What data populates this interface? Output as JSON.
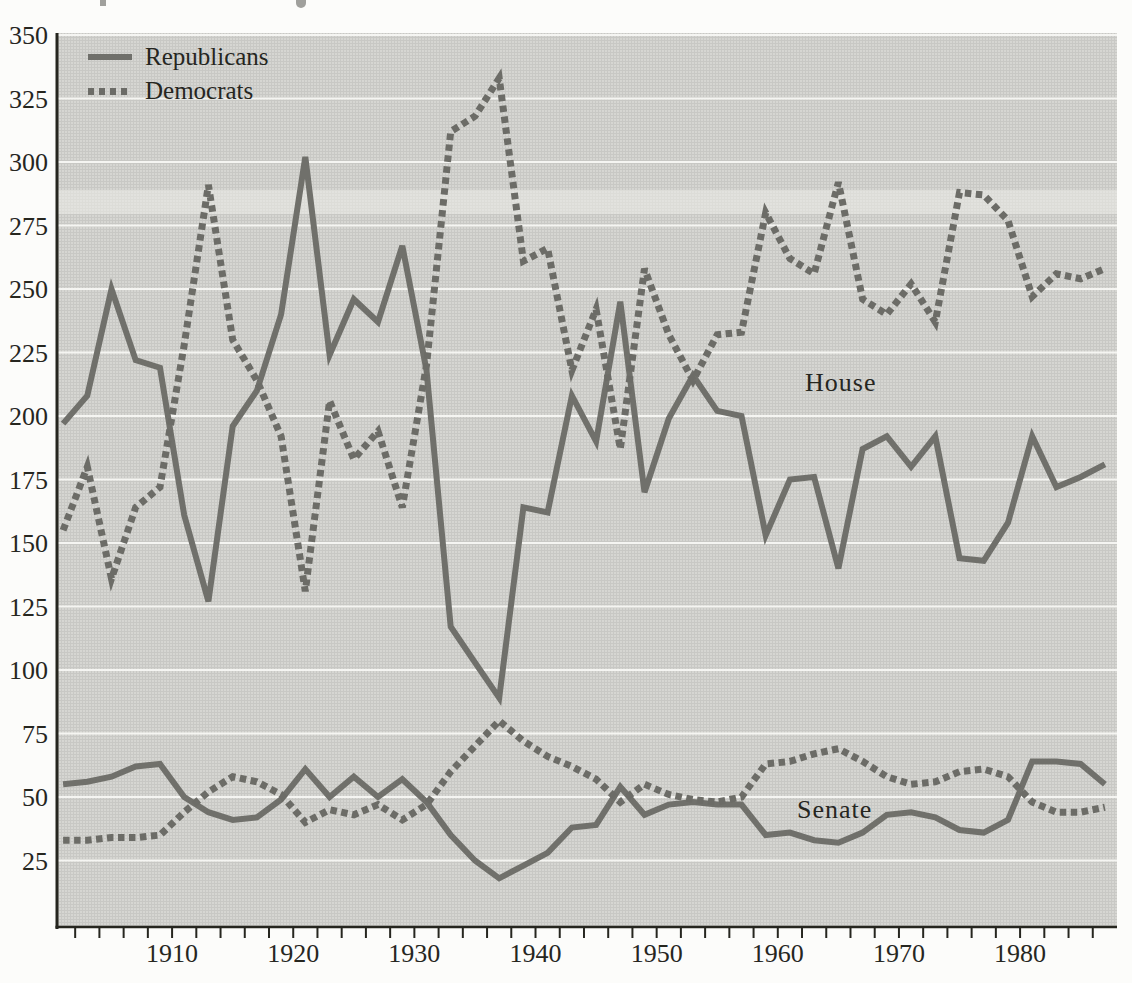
{
  "figure": {
    "background_color": "#fcfcfa",
    "plot_background_color": "#d6d6d2",
    "gridline_color": "#f5f5f2",
    "axis_color": "#26261f",
    "text_color": "#26261f",
    "republican_line_color": "#70706b",
    "democrat_line_color": "#6c6c67"
  },
  "legend": {
    "republicans_label": "Republicans",
    "democrats_label": "Democrats"
  },
  "annotations": {
    "house_label": "House",
    "senate_label": "Senate"
  },
  "chart_data": {
    "type": "line",
    "title": "",
    "xlabel": "",
    "ylabel": "",
    "xlim": [
      1900.5,
      1988
    ],
    "ylim": [
      0,
      350
    ],
    "grid": "horizontal-white",
    "legend_position": "top-left-inside",
    "y_ticks": [
      25,
      50,
      75,
      100,
      125,
      150,
      175,
      200,
      225,
      250,
      275,
      300,
      325,
      350
    ],
    "x_tick_labels": [
      1910,
      1920,
      1930,
      1940,
      1950,
      1960,
      1970,
      1980
    ],
    "x_minor_tick_start": 1902,
    "x_minor_tick_end": 1986,
    "x_minor_tick_step": 2,
    "x": [
      1901,
      1903,
      1905,
      1907,
      1909,
      1911,
      1913,
      1915,
      1917,
      1919,
      1921,
      1923,
      1925,
      1927,
      1929,
      1931,
      1933,
      1935,
      1937,
      1939,
      1941,
      1943,
      1945,
      1947,
      1949,
      1951,
      1953,
      1955,
      1957,
      1959,
      1961,
      1963,
      1965,
      1967,
      1969,
      1971,
      1973,
      1975,
      1977,
      1979,
      1981,
      1983,
      1985,
      1987
    ],
    "series": [
      {
        "name": "House Republicans",
        "chamber": "House",
        "party": "Republicans",
        "style": "solid",
        "values": [
          197,
          208,
          250,
          222,
          219,
          161,
          127,
          196,
          210,
          240,
          302,
          224,
          246,
          237,
          267,
          218,
          117,
          103,
          89,
          164,
          162,
          208,
          190,
          245,
          170,
          199,
          216,
          202,
          200,
          153,
          175,
          176,
          140,
          187,
          192,
          180,
          192,
          144,
          143,
          158,
          192,
          172,
          176,
          181
        ]
      },
      {
        "name": "House Democrats",
        "chamber": "House",
        "party": "Democrats",
        "style": "dashed",
        "values": [
          155,
          180,
          136,
          164,
          172,
          228,
          291,
          230,
          214,
          192,
          131,
          206,
          183,
          194,
          164,
          220,
          312,
          318,
          333,
          261,
          266,
          218,
          242,
          187,
          258,
          232,
          214,
          232,
          233,
          280,
          262,
          256,
          292,
          246,
          240,
          252,
          237,
          288,
          287,
          277,
          247,
          256,
          254,
          258
        ]
      },
      {
        "name": "Senate Republicans",
        "chamber": "Senate",
        "party": "Republicans",
        "style": "solid",
        "values": [
          55,
          56,
          58,
          62,
          63,
          50,
          44,
          41,
          42,
          49,
          61,
          50,
          58,
          50,
          57,
          48,
          35,
          25,
          18,
          23,
          28,
          38,
          39,
          54,
          43,
          47,
          48,
          47,
          47,
          35,
          36,
          33,
          32,
          36,
          43,
          44,
          42,
          37,
          36,
          41,
          64,
          64,
          63,
          55
        ]
      },
      {
        "name": "Senate Democrats",
        "chamber": "Senate",
        "party": "Democrats",
        "style": "dashed",
        "values": [
          33,
          33,
          34,
          34,
          35,
          44,
          52,
          58,
          56,
          51,
          40,
          45,
          43,
          47,
          41,
          47,
          60,
          70,
          80,
          72,
          66,
          62,
          57,
          48,
          55,
          51,
          49,
          48,
          50,
          63,
          64,
          67,
          69,
          64,
          58,
          55,
          56,
          60,
          61,
          58,
          48,
          44,
          44,
          46
        ]
      }
    ]
  }
}
